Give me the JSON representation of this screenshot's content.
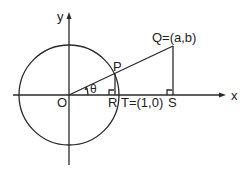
{
  "diagram": {
    "type": "unit-circle-geometry",
    "axes": {
      "x_label": "x",
      "y_label": "y"
    },
    "points": {
      "origin": "O",
      "P": "P",
      "Q": "Q=(a,b)",
      "R": "R",
      "T": "T=(1,0)",
      "S": "S"
    },
    "angle_label": "θ",
    "colors": {
      "stroke": "#2a2a2a",
      "background": "#ffffff"
    }
  }
}
